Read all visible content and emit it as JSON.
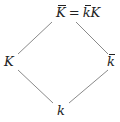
{
  "diagram": {
    "type": "field-extension-lattice",
    "nodes": {
      "top": {
        "base": "K",
        "bar": true,
        "equals": "=",
        "rhs_bar": "k",
        "rhs_plain": "K"
      },
      "left": {
        "base": "K",
        "bar": false
      },
      "right": {
        "base": "k",
        "bar": true
      },
      "bottom": {
        "base": "k",
        "bar": false
      }
    },
    "edges": [
      {
        "from": "top",
        "to": "left"
      },
      {
        "from": "top",
        "to": "right"
      },
      {
        "from": "left",
        "to": "bottom"
      },
      {
        "from": "right",
        "to": "bottom"
      }
    ],
    "line_color": "#888888"
  }
}
